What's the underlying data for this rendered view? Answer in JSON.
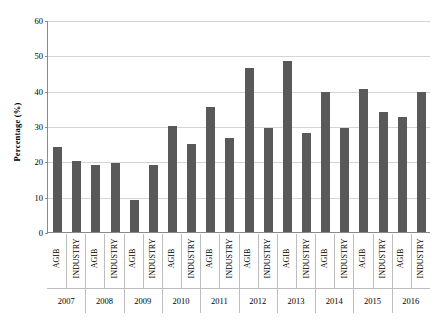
{
  "chart_data": {
    "type": "bar",
    "title": "",
    "subtitle": "",
    "xlabel": "",
    "ylabel": "Percentage (%)",
    "ylim": [
      0,
      60
    ],
    "ytick_labels": [
      "0",
      "10",
      "20",
      "30",
      "40",
      "50",
      "60"
    ],
    "ytick_values": [
      0,
      10,
      20,
      30,
      40,
      50,
      60
    ],
    "grid": true,
    "legend": false,
    "legend_position": "none",
    "bar_color": "#595959",
    "gridline_color": "#d4d4d4",
    "axis_color": "#8a8a8a",
    "group_label": "Year",
    "groups": [
      "2007",
      "2008",
      "2009",
      "2010",
      "2011",
      "2012",
      "2013",
      "2014",
      "2015",
      "2016"
    ],
    "categories": [
      "AGIB",
      "INDUSTRY",
      "AGIB",
      "INDUSTRY",
      "AGIB",
      "INDUSTRY",
      "AGIB",
      "INDUSTRY",
      "AGIB",
      "INDUSTRY",
      "AGIB",
      "INDUSTRY",
      "AGIB",
      "INDUSTRY",
      "AGIB",
      "INDUSTRY",
      "AGIB",
      "INDUSTRY",
      "AGIB",
      "INDUSTRY"
    ],
    "values": [
      24.0,
      20.0,
      19.0,
      19.5,
      9.0,
      19.0,
      30.0,
      25.0,
      35.5,
      26.5,
      46.5,
      29.5,
      48.5,
      28.0,
      39.5,
      29.5,
      40.5,
      34.0,
      32.5,
      39.5
    ],
    "series": [
      {
        "name": "Percentage",
        "values": [
          24.0,
          20.0,
          19.0,
          19.5,
          9.0,
          19.0,
          30.0,
          25.0,
          35.5,
          26.5,
          46.5,
          29.5,
          48.5,
          28.0,
          39.5,
          29.5,
          40.5,
          34.0,
          32.5,
          39.5
        ]
      }
    ]
  }
}
